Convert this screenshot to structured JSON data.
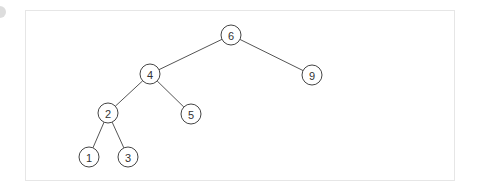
{
  "diagram": {
    "type": "binary-search-tree",
    "nodes": [
      {
        "id": "n6",
        "label": "6",
        "x": 231,
        "y": 35
      },
      {
        "id": "n4",
        "label": "4",
        "x": 150,
        "y": 74
      },
      {
        "id": "n9",
        "label": "9",
        "x": 312,
        "y": 75
      },
      {
        "id": "n2",
        "label": "2",
        "x": 108,
        "y": 113
      },
      {
        "id": "n5",
        "label": "5",
        "x": 191,
        "y": 114
      },
      {
        "id": "n1",
        "label": "1",
        "x": 89,
        "y": 157
      },
      {
        "id": "n3",
        "label": "3",
        "x": 128,
        "y": 157
      }
    ],
    "edges": [
      {
        "from": "n6",
        "to": "n4"
      },
      {
        "from": "n6",
        "to": "n9"
      },
      {
        "from": "n4",
        "to": "n2"
      },
      {
        "from": "n4",
        "to": "n5"
      },
      {
        "from": "n2",
        "to": "n1"
      },
      {
        "from": "n2",
        "to": "n3"
      }
    ],
    "node_radius": 10
  }
}
